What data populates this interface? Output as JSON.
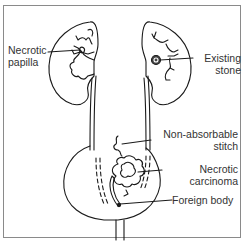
{
  "diagram": {
    "labels": {
      "necrotic_papilla": [
        "Necrotic",
        "papilla"
      ],
      "existing_stone": [
        "Existing",
        "stone"
      ],
      "non_absorbable_stitch": [
        "Non-absorbable",
        "stitch"
      ],
      "necrotic_carcinoma": [
        "Necrotic",
        "carcinoma"
      ],
      "foreign_body": "Foreign body"
    },
    "colors": {
      "line": "#1a1a1a",
      "text": "#333333",
      "frame": "#8a8a8a"
    }
  }
}
